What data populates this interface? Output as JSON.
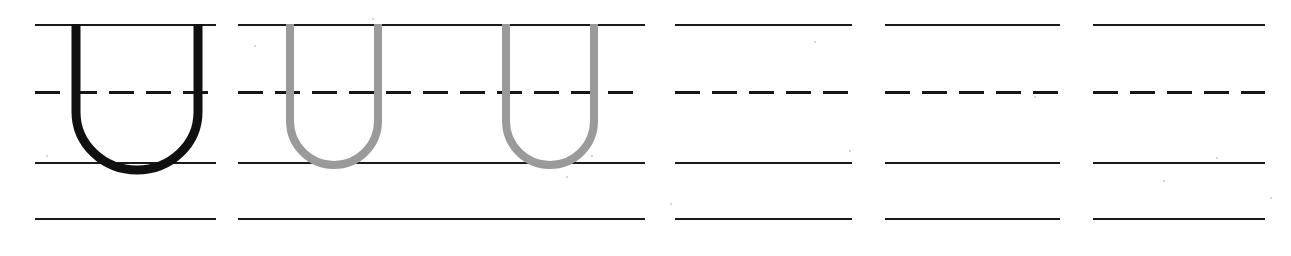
{
  "worksheet": {
    "title": "Letter U handwriting practice worksheet",
    "letter": "U",
    "letter_case": "uppercase",
    "page_width": 1291,
    "page_height": 256,
    "background_color": "#ffffff",
    "rule_color": "#1a1a1a",
    "model_letter_color": "#101010",
    "trace_letter_color": "#9a9a9a",
    "guide_rows": {
      "top_line_y": 24,
      "dashed_midline_y": 93,
      "baseline_y": 162,
      "descender_line_y": 218
    },
    "dash_pattern": {
      "dash_length": 25,
      "gap_length": 12,
      "dashes_per_cell": 5
    },
    "cells": [
      {
        "index": 1,
        "type": "model",
        "content": "U",
        "content_style": "solid-black",
        "x": 35,
        "width": 181,
        "glyph_x": 36,
        "glyph_width": 142,
        "stroke_width": 8,
        "color": "#101010"
      },
      {
        "index": 2,
        "type": "trace",
        "content": "U",
        "content_style": "gray-trace",
        "x": 238,
        "width": 407,
        "glyph_x": 48,
        "glyph_width": 94,
        "stroke_width": 7,
        "color": "#9a9a9a"
      },
      {
        "index": 3,
        "type": "trace",
        "content": "U",
        "content_style": "gray-trace",
        "x": 238,
        "width": 407,
        "glyph_x": 264,
        "glyph_width": 94,
        "stroke_width": 7,
        "color": "#9a9a9a"
      },
      {
        "index": 4,
        "type": "blank",
        "content": "",
        "content_style": "empty",
        "x": 675,
        "width": 177,
        "color": "#ffffff"
      },
      {
        "index": 5,
        "type": "blank",
        "content": "",
        "content_style": "empty",
        "x": 885,
        "width": 175,
        "color": "#ffffff"
      },
      {
        "index": 6,
        "type": "blank",
        "content": "",
        "content_style": "empty",
        "x": 1093,
        "width": 172,
        "color": "#ffffff"
      }
    ],
    "rule_groups": [
      {
        "index": 1,
        "x": 35,
        "width": 181
      },
      {
        "index": 2,
        "x": 238,
        "width": 407
      },
      {
        "index": 3,
        "x": 675,
        "width": 177
      },
      {
        "index": 4,
        "x": 885,
        "width": 175
      },
      {
        "index": 5,
        "x": 1093,
        "width": 172
      }
    ],
    "specks": [
      {
        "x": 46,
        "y": 155,
        "size": 2
      },
      {
        "x": 254,
        "y": 45,
        "size": 2
      },
      {
        "x": 372,
        "y": 18,
        "size": 2
      },
      {
        "x": 566,
        "y": 176,
        "size": 2
      },
      {
        "x": 591,
        "y": 155,
        "size": 2
      },
      {
        "x": 670,
        "y": 203,
        "size": 2
      },
      {
        "x": 814,
        "y": 41,
        "size": 2
      },
      {
        "x": 849,
        "y": 150,
        "size": 2
      },
      {
        "x": 1034,
        "y": 96,
        "size": 2
      },
      {
        "x": 1163,
        "y": 180,
        "size": 2
      },
      {
        "x": 1216,
        "y": 157,
        "size": 2
      },
      {
        "x": 1270,
        "y": 197,
        "size": 2
      }
    ]
  }
}
